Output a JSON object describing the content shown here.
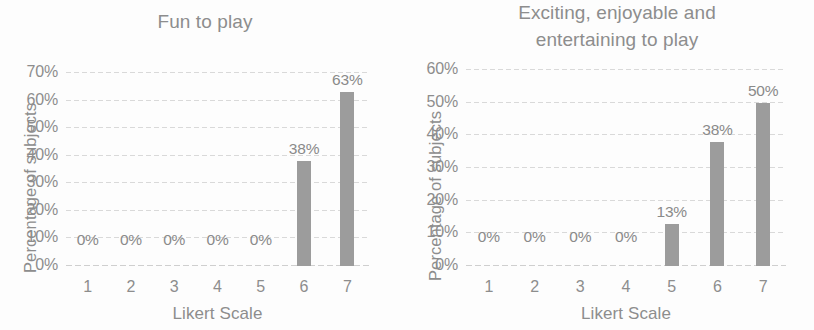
{
  "figure": {
    "background_color": "#fdfdfd",
    "bar_color": "#9c9c9c",
    "text_color": "#8d8d8d",
    "gridline_color": "#d9d9d9"
  },
  "charts": [
    {
      "title": "Fun to play",
      "ylabel": "Percentage of subjects",
      "xlabel": "Likert Scale",
      "xticks": [
        "1",
        "2",
        "3",
        "4",
        "5",
        "6",
        "7"
      ],
      "yticks": [
        "0%",
        "10%",
        "20%",
        "30%",
        "40%",
        "50%",
        "60%",
        "70%"
      ],
      "bar_labels": [
        "0%",
        "0%",
        "0%",
        "0%",
        "0%",
        "38%",
        "63%"
      ]
    },
    {
      "title": "Exciting, enjoyable and\nentertaining to play",
      "ylabel": "Percentage of subjects",
      "xlabel": "Likert Scale",
      "xticks": [
        "1",
        "2",
        "3",
        "4",
        "5",
        "6",
        "7"
      ],
      "yticks": [
        "0%",
        "10%",
        "20%",
        "30%",
        "40%",
        "50%",
        "60%"
      ],
      "bar_labels": [
        "0%",
        "0%",
        "0%",
        "0%",
        "13%",
        "38%",
        "50%"
      ]
    }
  ],
  "chart_data": [
    {
      "type": "bar",
      "title": "Fun to play",
      "xlabel": "Likert Scale",
      "ylabel": "Percentage of subjects",
      "categories": [
        "1",
        "2",
        "3",
        "4",
        "5",
        "6",
        "7"
      ],
      "values": [
        0,
        0,
        0,
        0,
        0,
        38,
        63
      ],
      "data_labels": [
        "0%",
        "0%",
        "0%",
        "0%",
        "0%",
        "38%",
        "63%"
      ],
      "ylim": [
        0,
        70
      ],
      "ytick_values": [
        0,
        10,
        20,
        30,
        40,
        50,
        60,
        70
      ],
      "ytick_labels": [
        "0%",
        "10%",
        "20%",
        "30%",
        "40%",
        "50%",
        "60%",
        "70%"
      ],
      "grid": true,
      "legend": false,
      "units": "percent"
    },
    {
      "type": "bar",
      "title": "Exciting, enjoyable and entertaining to play",
      "xlabel": "Likert Scale",
      "ylabel": "Percentage of subjects",
      "categories": [
        "1",
        "2",
        "3",
        "4",
        "5",
        "6",
        "7"
      ],
      "values": [
        0,
        0,
        0,
        0,
        13,
        38,
        50
      ],
      "data_labels": [
        "0%",
        "0%",
        "0%",
        "0%",
        "13%",
        "38%",
        "50%"
      ],
      "ylim": [
        0,
        60
      ],
      "ytick_values": [
        0,
        10,
        20,
        30,
        40,
        50,
        60
      ],
      "ytick_labels": [
        "0%",
        "10%",
        "20%",
        "30%",
        "40%",
        "50%",
        "60%"
      ],
      "grid": true,
      "legend": false,
      "units": "percent"
    }
  ]
}
